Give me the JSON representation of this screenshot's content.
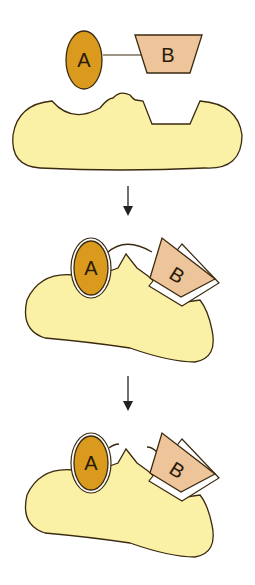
{
  "diagram": {
    "stages": [
      {
        "name": "separate",
        "substrate_a_label": "A",
        "substrate_b_label": "B",
        "linked": true
      },
      {
        "name": "bound-linked",
        "substrate_a_label": "A",
        "substrate_b_label": "B",
        "linked": true
      },
      {
        "name": "bound-cleaved",
        "substrate_a_label": "A",
        "substrate_b_label": "B",
        "linked": false
      }
    ],
    "colors": {
      "enzyme_fill": "#faf0a6",
      "substrate_a_fill": "#d99a1e",
      "substrate_b_fill": "#eec49a",
      "outline": "#3a2a10"
    }
  }
}
